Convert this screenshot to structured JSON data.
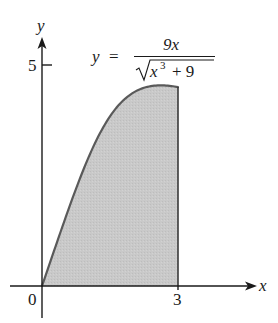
{
  "chart_data": {
    "type": "area",
    "title": "",
    "equation": {
      "lhs": "y",
      "equals": "=",
      "numerator": "9x",
      "denominator_radicand_base": "x",
      "denominator_exponent": "3",
      "denominator_rest": "+ 9"
    },
    "function": "y = 9x / sqrt(x^3 + 9)",
    "xlabel": "x",
    "ylabel": "y",
    "x_ticks": [
      {
        "value": 0,
        "label": "0"
      },
      {
        "value": 3,
        "label": "3"
      }
    ],
    "y_ticks": [
      {
        "value": 5,
        "label": "5"
      }
    ],
    "shaded_region": {
      "x_from": 0,
      "x_to": 3,
      "description": "area under curve between x=0 and x=3"
    },
    "x": [
      0,
      0.5,
      1,
      1.5,
      2,
      2.5,
      2.62,
      3
    ],
    "y": [
      0,
      1.49,
      2.85,
      3.87,
      4.42,
      4.53,
      4.54,
      4.5
    ],
    "xlim": [
      0,
      4.7
    ],
    "ylim": [
      0,
      5.5
    ],
    "grid": false,
    "colors": {
      "fill": "#c8c8c8",
      "curve": "#5a5a5a",
      "axis": "#1a1a1a"
    }
  },
  "labels": {
    "x_axis": "x",
    "y_axis": "y",
    "tick_x0": "0",
    "tick_x3": "3",
    "tick_y5": "5",
    "eq_lhs": "y",
    "eq_equals": "=",
    "eq_numerator": "9x",
    "eq_den_base": "x",
    "eq_den_exp": "3",
    "eq_den_rest": "+ 9"
  }
}
